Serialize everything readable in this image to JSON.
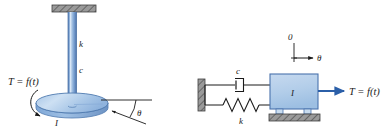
{
  "figure": {
    "title": "",
    "background_color": "#ffffff",
    "width": 381,
    "height": 140,
    "colors": {
      "shaft_blue_dark": "#4a73ad",
      "shaft_blue_mid": "#7da3d4",
      "shaft_blue_light": "#cfe0f2",
      "disk_fill": "#9dbfe3",
      "disk_top": "#bcd5ee",
      "block_fill": "#b8d1ea",
      "block_stroke": "#4a73ad",
      "arrow_blue": "#2b5fa8",
      "hatch_gray": "#808080",
      "line_black": "#1a1a1a"
    }
  },
  "panels": [
    {
      "id": "torsional-shaft-disk",
      "name": "left-diagram",
      "elements": {
        "ceiling_bracket": "hatched-support-icon",
        "shaft": "vertical-shaft",
        "disk": "rotating-disk",
        "rotation_arc": "curved-arrow-icon",
        "angle_arc": "angle-arc-icon",
        "reference_line": "horizontal-reference-line"
      },
      "labels": {
        "stiffness": "k",
        "damping": "c",
        "inertia": "I",
        "torque": "T = f(t)",
        "angle": "θ"
      }
    },
    {
      "id": "lumped-parameter-model",
      "name": "right-diagram",
      "elements": {
        "wall": "hatched-wall-icon",
        "damper": "damper-symbol",
        "spring": "spring-symbol",
        "mass_block": "inertia-block",
        "rollers": "roller-supports",
        "ground": "hatched-ground-icon",
        "torque_arrow": "arrow-right-icon",
        "coordinate_arrow": "arrow-right-icon",
        "origin_tick": "origin-tick-mark"
      },
      "labels": {
        "damping": "c",
        "stiffness": "k",
        "inertia": "I",
        "torque": "T = f(t)",
        "angle": "θ",
        "origin": "0"
      }
    }
  ]
}
